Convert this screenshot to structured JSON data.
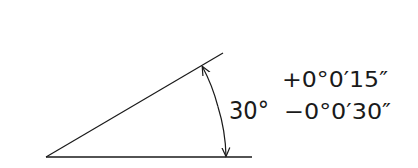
{
  "diagram": {
    "type": "angular-dimension-tolerance",
    "nominal_angle": "30°",
    "upper_tolerance": "+0°0′15″",
    "lower_tolerance": "−0°0′30″",
    "line_color": "#1a1a1a",
    "background": "#ffffff"
  }
}
